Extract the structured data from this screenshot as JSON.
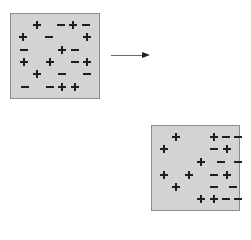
{
  "diagram": {
    "colors": {
      "panel_fill": "#d3d3d3",
      "panel_border": "#8c8c8c",
      "symbol": "#1e1e1e",
      "arrow": "#6a6a6a"
    },
    "panels": [
      {
        "id": "before",
        "box": {
          "left": 10,
          "top": 13,
          "width": 90,
          "height": 86
        },
        "symbols": [
          {
            "t": "plus",
            "x": 37,
            "y": 25
          },
          {
            "t": "minus",
            "x": 61,
            "y": 25
          },
          {
            "t": "plus",
            "x": 73,
            "y": 25
          },
          {
            "t": "minus",
            "x": 86,
            "y": 25
          },
          {
            "t": "plus",
            "x": 23,
            "y": 37
          },
          {
            "t": "minus",
            "x": 49,
            "y": 37
          },
          {
            "t": "plus",
            "x": 87,
            "y": 37
          },
          {
            "t": "minus",
            "x": 24,
            "y": 50
          },
          {
            "t": "plus",
            "x": 62,
            "y": 50
          },
          {
            "t": "minus",
            "x": 75,
            "y": 50
          },
          {
            "t": "plus",
            "x": 24,
            "y": 62
          },
          {
            "t": "plus",
            "x": 50,
            "y": 62
          },
          {
            "t": "minus",
            "x": 75,
            "y": 62
          },
          {
            "t": "plus",
            "x": 87,
            "y": 62
          },
          {
            "t": "plus",
            "x": 37,
            "y": 74
          },
          {
            "t": "minus",
            "x": 62,
            "y": 74
          },
          {
            "t": "minus",
            "x": 87,
            "y": 74
          },
          {
            "t": "minus",
            "x": 25,
            "y": 87
          },
          {
            "t": "minus",
            "x": 50,
            "y": 87
          },
          {
            "t": "plus",
            "x": 62,
            "y": 87
          },
          {
            "t": "plus",
            "x": 75,
            "y": 87
          }
        ]
      },
      {
        "id": "after",
        "box": {
          "left": 151,
          "top": 125,
          "width": 89,
          "height": 86
        },
        "symbols": [
          {
            "t": "plus",
            "x": 176,
            "y": 137
          },
          {
            "t": "plus",
            "x": 214,
            "y": 137
          },
          {
            "t": "minus",
            "x": 226,
            "y": 137
          },
          {
            "t": "minus",
            "x": 238,
            "y": 137
          },
          {
            "t": "plus",
            "x": 164,
            "y": 149
          },
          {
            "t": "minus",
            "x": 214,
            "y": 149
          },
          {
            "t": "plus",
            "x": 227,
            "y": 149
          },
          {
            "t": "plus",
            "x": 201,
            "y": 162
          },
          {
            "t": "minus",
            "x": 221,
            "y": 162
          },
          {
            "t": "minus",
            "x": 238,
            "y": 162
          },
          {
            "t": "plus",
            "x": 164,
            "y": 175
          },
          {
            "t": "plus",
            "x": 189,
            "y": 175
          },
          {
            "t": "minus",
            "x": 214,
            "y": 175
          },
          {
            "t": "plus",
            "x": 227,
            "y": 175
          },
          {
            "t": "plus",
            "x": 176,
            "y": 187
          },
          {
            "t": "minus",
            "x": 214,
            "y": 187
          },
          {
            "t": "minus",
            "x": 233,
            "y": 187
          },
          {
            "t": "plus",
            "x": 201,
            "y": 199
          },
          {
            "t": "plus",
            "x": 214,
            "y": 199
          },
          {
            "t": "minus",
            "x": 226,
            "y": 199
          },
          {
            "t": "minus",
            "x": 238,
            "y": 199
          }
        ]
      }
    ],
    "arrow": {
      "direction": "right",
      "from": [
        111,
        55
      ],
      "to": [
        151,
        55
      ]
    }
  }
}
